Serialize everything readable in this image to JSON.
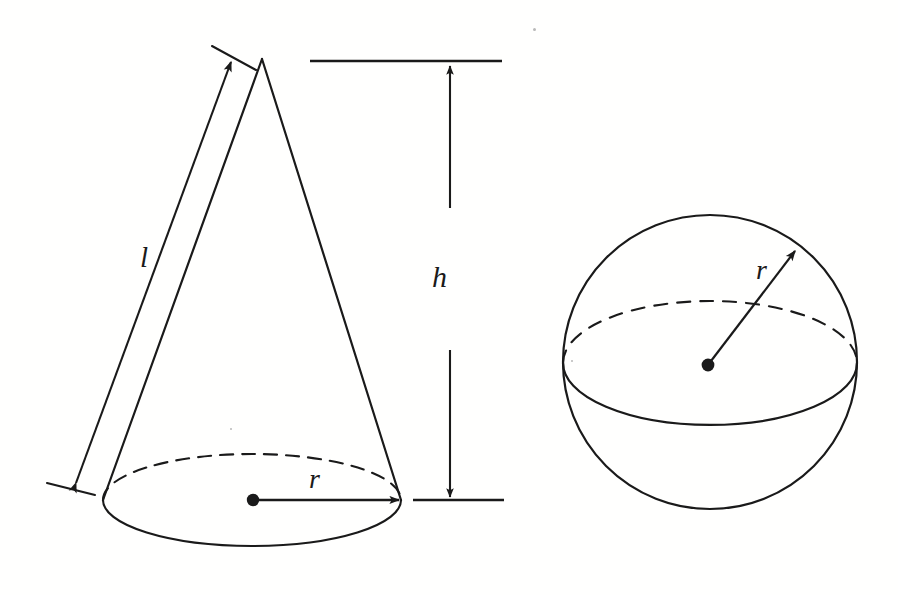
{
  "figure": {
    "background_color": "#fffffe",
    "ink_color": "#1a1a1a",
    "labels": {
      "slant_height": "l",
      "height": "h",
      "cone_radius": "r",
      "sphere_radius": "r"
    },
    "shapes": [
      {
        "name": "cone",
        "kind": "cone",
        "apex": [
          262,
          59
        ],
        "base_center": [
          252,
          500
        ],
        "base_semi_major_x": 149,
        "base_semi_minor_y": 46,
        "left_base_corner": [
          103,
          500
        ],
        "right_base_corner": [
          401,
          500
        ],
        "hidden_arc": "top-dashed",
        "visible_arc": "bottom-solid",
        "center_dot": [
          253,
          500
        ]
      },
      {
        "name": "sphere",
        "kind": "sphere",
        "center": [
          710,
          362
        ],
        "radius": 147,
        "equator_center": [
          710,
          363
        ],
        "equator_semi_major_x": 147,
        "equator_semi_minor_y": 62,
        "hidden_arc": "top-dashed",
        "visible_arc": "bottom-solid",
        "center_dot": [
          708,
          365
        ],
        "radius_arrow_tip": [
          797,
          248
        ]
      }
    ],
    "dimensions": [
      {
        "name": "slant-height-dimension",
        "label": "l",
        "arrow_heads": "both",
        "from": [
          74,
          487
        ],
        "to": [
          231,
          58
        ],
        "label_position": [
          150,
          262
        ],
        "extension_tick_top": [
          [
            212,
            46
          ],
          [
            256,
            70
          ]
        ],
        "extension_tick_bottom": [
          [
            47,
            483
          ],
          [
            95,
            495
          ]
        ]
      },
      {
        "name": "height-dimension",
        "label": "h",
        "arrow_heads": "both",
        "shaft_x": 450,
        "top_arrow_tip": [
          450,
          64
        ],
        "top_arrow_shaft_end": [
          450,
          208
        ],
        "bottom_arrow_shaft_start": [
          450,
          350
        ],
        "bottom_arrow_tip": [
          450,
          499
        ],
        "label_position": [
          443,
          280
        ],
        "top_reference_line": [
          [
            310,
            61
          ],
          [
            502,
            61
          ]
        ],
        "bottom_reference_line": [
          [
            413,
            500
          ],
          [
            504,
            500
          ]
        ]
      },
      {
        "name": "cone-radius-dimension",
        "label": "r",
        "arrow_heads": "end",
        "from": [
          253,
          500
        ],
        "to": [
          401,
          500
        ],
        "label_position": [
          318,
          481
        ]
      },
      {
        "name": "sphere-radius-dimension",
        "label": "r",
        "arrow_heads": "end",
        "from": [
          708,
          365
        ],
        "to": [
          797,
          248
        ],
        "label_position": [
          766,
          272
        ]
      }
    ]
  }
}
